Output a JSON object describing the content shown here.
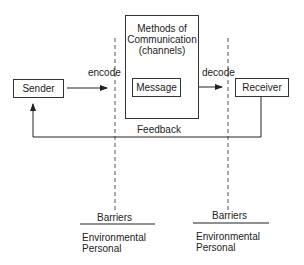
{
  "diagram": {
    "nodes": {
      "sender": "Sender",
      "channel_title": [
        "Methods of",
        "Communication",
        "(channels)"
      ],
      "message": "Message",
      "receiver": "Receiver"
    },
    "edges": {
      "encode": "encode",
      "decode": "decode",
      "feedback": "Feedback"
    },
    "barriers": [
      {
        "title": "Barriers",
        "items": [
          "Environmental",
          "Personal"
        ]
      },
      {
        "title": "Barriers",
        "items": [
          "Environmental",
          "Personal"
        ]
      }
    ]
  }
}
